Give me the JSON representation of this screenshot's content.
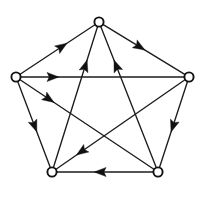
{
  "figure": {
    "width": 204,
    "height": 199,
    "background_color": "#ffffff",
    "edge_color": "#1c1c1c",
    "arrow_color": "#111111",
    "vertex_fill_color": "#ffffff",
    "vertex_stroke_color": "#111111",
    "vertex_radius": 4.6,
    "edge_stroke_width": 1.35,
    "arrow_length": 12,
    "arrow_half_width": 4.6
  },
  "graph": {
    "type": "directed-graph",
    "node_count": 5,
    "edge_count": 10,
    "nodes": [
      {
        "id": "top",
        "label": "",
        "x": 99,
        "y": 22
      },
      {
        "id": "right",
        "label": "",
        "x": 189,
        "y": 77
      },
      {
        "id": "bottom_right",
        "label": "",
        "x": 158,
        "y": 172
      },
      {
        "id": "bottom_left",
        "label": "",
        "x": 52,
        "y": 172
      },
      {
        "id": "left",
        "label": "",
        "x": 16,
        "y": 77
      }
    ],
    "edges": [
      {
        "id": "e1",
        "from": "left",
        "to": "top",
        "kind": "pentagon-side",
        "arrow_t": 0.56
      },
      {
        "id": "e2",
        "from": "top",
        "to": "right",
        "kind": "pentagon-side",
        "arrow_t": 0.45
      },
      {
        "id": "e3",
        "from": "right",
        "to": "bottom_right",
        "kind": "pentagon-side",
        "arrow_t": 0.52
      },
      {
        "id": "e4",
        "from": "bottom_right",
        "to": "bottom_left",
        "kind": "pentagon-side",
        "arrow_t": 0.55
      },
      {
        "id": "e5",
        "from": "left",
        "to": "bottom_left",
        "kind": "pentagon-side",
        "arrow_t": 0.52
      },
      {
        "id": "e6",
        "from": "left",
        "to": "right",
        "kind": "chord",
        "arrow_t": 0.2
      },
      {
        "id": "e7",
        "from": "left",
        "to": "bottom_right",
        "kind": "chord",
        "arrow_t": 0.22
      },
      {
        "id": "e8",
        "from": "bottom_left",
        "to": "top",
        "kind": "chord",
        "arrow_t": 0.72
      },
      {
        "id": "e9",
        "from": "bottom_right",
        "to": "top",
        "kind": "chord",
        "arrow_t": 0.72
      },
      {
        "id": "e10",
        "from": "right",
        "to": "bottom_left",
        "kind": "chord",
        "arrow_t": 0.8
      }
    ]
  }
}
